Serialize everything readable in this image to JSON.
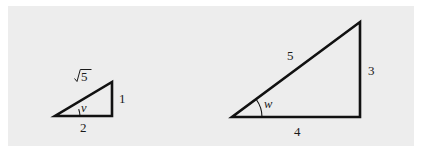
{
  "figure": {
    "background_color": "#ededed",
    "page_color": "#ffffff",
    "stroke_color": "#111111",
    "triangles": [
      {
        "name": "small-triangle",
        "hypotenuse_label": "√5",
        "hypotenuse_radicand": "5",
        "vertical_label": "1",
        "base_label": "2",
        "angle_label": "v"
      },
      {
        "name": "large-triangle",
        "hypotenuse_label": "5",
        "vertical_label": "3",
        "base_label": "4",
        "angle_label": "w"
      }
    ]
  }
}
